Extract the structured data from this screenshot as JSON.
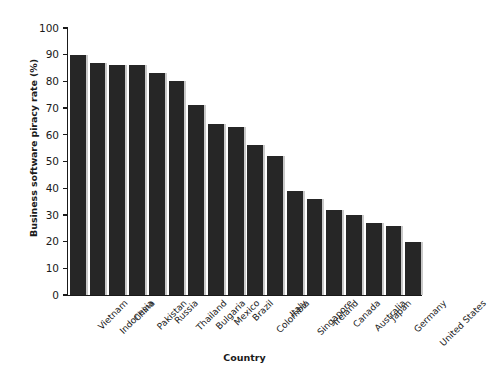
{
  "chart_data": {
    "type": "bar",
    "title": "",
    "xlabel": "Country",
    "ylabel": "Business software piracy rate (%)",
    "ylim": [
      0,
      100
    ],
    "ytick_step": 10,
    "yticks": [
      0,
      10,
      20,
      30,
      40,
      50,
      60,
      70,
      80,
      90,
      100
    ],
    "grid": false,
    "legend": false,
    "bar_color": "#262626",
    "bar_shadow_color": "#c9c9c9",
    "axis_color": "#1a1a1a",
    "background_color": "#ffffff",
    "categories": [
      "Vietnam",
      "Indonesia",
      "China",
      "Pakistan",
      "Russia",
      "Thailand",
      "Bulgaria",
      "Mexico",
      "Brazil",
      "Colombia",
      "Italy",
      "Singapore",
      "Ireland",
      "Canada",
      "Australia",
      "Japan",
      "Germany",
      "United States"
    ],
    "values": [
      90,
      87,
      86,
      86,
      83,
      80,
      71,
      64,
      63,
      56,
      52,
      39,
      36,
      32,
      30,
      27,
      26,
      20
    ]
  }
}
